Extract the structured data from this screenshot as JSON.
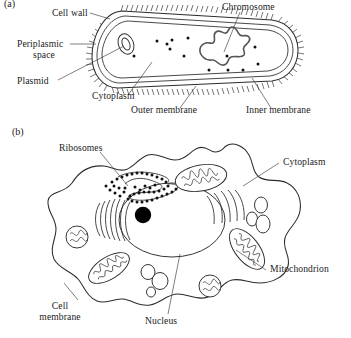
{
  "figure": {
    "background_color": "#ffffff",
    "ink_color": "#2b2b2b",
    "panels": [
      {
        "id": "(a)",
        "subject": "prokaryotic-bacterial-cell",
        "labels": [
          "Cell wall",
          "Periplasmic",
          "space",
          "Plasmid",
          "Cytoplasm",
          "Outer membrane",
          "Inner membrane",
          "Chromosome"
        ]
      },
      {
        "id": "(b)",
        "subject": "eukaryotic-animal-cell",
        "labels": [
          "Ribosomes",
          "Cytoplasm",
          "Mitochondrion",
          "Cell",
          "membrane",
          "Nucleus"
        ]
      }
    ]
  },
  "panel_a": {
    "panel_id": "(a)",
    "label_cell_wall": "Cell wall",
    "label_periplasmic_line1": "Periplasmic",
    "label_periplasmic_line2": "space",
    "label_plasmid": "Plasmid",
    "label_cytoplasm": "Cytoplasm",
    "label_outer_membrane": "Outer membrane",
    "label_inner_membrane": "Inner membrane",
    "label_chromosome": "Chromosome"
  },
  "panel_b": {
    "panel_id": "(b)",
    "label_ribosomes": "Ribosomes",
    "label_cytoplasm": "Cytoplasm",
    "label_mitochondrion": "Mitochondrion",
    "label_cell_membrane_line1": "Cell",
    "label_cell_membrane_line2": "membrane",
    "label_nucleus": "Nucleus"
  }
}
